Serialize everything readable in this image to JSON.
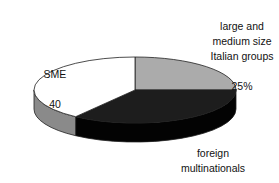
{
  "chart_data": {
    "type": "pie",
    "style": "3d",
    "title": "",
    "background": "#ffffff",
    "outline_color": "#1f1f1f",
    "start_angle_deg": 0,
    "direction": "clockwise",
    "legend_position": "labels-around-pie",
    "categories": [
      "large and medium size Italian groups",
      "foreign multinationals",
      "SME"
    ],
    "values": [
      25,
      35,
      40
    ],
    "slices": [
      {
        "label": "large and\nmedium size\nItalian groups",
        "value": 25,
        "display": "25%",
        "top_color": "#ababab",
        "side_color": "#8c8c8c"
      },
      {
        "label": "foreign\nmultinationals",
        "value": 35,
        "display": "35%",
        "top_color": "#1d1d1d",
        "side_color": "#030303"
      },
      {
        "label": "SME",
        "value": 40,
        "display": "40",
        "top_color": "#ffffff",
        "side_color": "#8a8a8a"
      }
    ]
  }
}
